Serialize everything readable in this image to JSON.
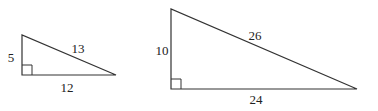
{
  "diagram": {
    "type": "similar right triangles",
    "triangles": [
      {
        "name": "small",
        "leg_vertical": "5",
        "leg_horizontal": "12",
        "hypotenuse": "13"
      },
      {
        "name": "large",
        "leg_vertical": "10",
        "leg_horizontal": "24",
        "hypotenuse": "26"
      }
    ],
    "colors": {
      "stroke": "#333333",
      "text": "#222222"
    }
  }
}
